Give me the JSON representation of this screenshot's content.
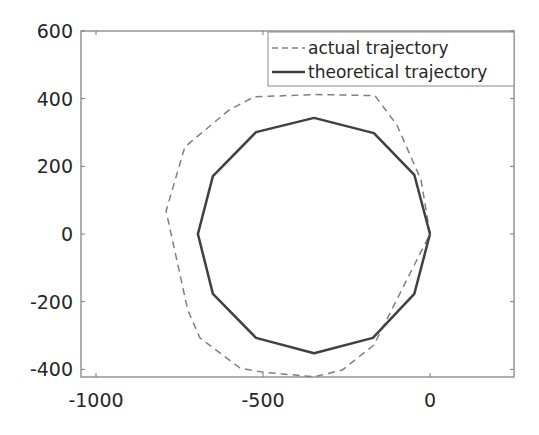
{
  "chart_data": {
    "type": "line",
    "title": "",
    "xlabel": "",
    "ylabel": "",
    "xlim": [
      -1045,
      250
    ],
    "ylim": [
      -420,
      600
    ],
    "grid": false,
    "legend_position": "upper right",
    "x_ticks": [
      -1000,
      -500,
      0
    ],
    "x_tick_labels": [
      "-1000",
      "-500",
      "0"
    ],
    "y_ticks": [
      -400,
      -200,
      0,
      200,
      400,
      600
    ],
    "y_tick_labels": [
      "-400",
      "-200",
      "0",
      "200",
      "400",
      "600"
    ],
    "series": [
      {
        "name": "actual trajectory",
        "style": "dashed",
        "color": "#7f7f7f",
        "points": [
          [
            0,
            0
          ],
          [
            -27,
            160
          ],
          [
            -99,
            322
          ],
          [
            -165,
            409
          ],
          [
            -347,
            412
          ],
          [
            -527,
            405
          ],
          [
            -602,
            366
          ],
          [
            -734,
            257
          ],
          [
            -790,
            68
          ],
          [
            -725,
            -225
          ],
          [
            -689,
            -307
          ],
          [
            -569,
            -396
          ],
          [
            -503,
            -408
          ],
          [
            -347,
            -422
          ],
          [
            -263,
            -402
          ],
          [
            -168,
            -328
          ],
          [
            0,
            0
          ]
        ]
      },
      {
        "name": "theoretical trajectory",
        "style": "solid",
        "color": "#404040",
        "points": [
          [
            0,
            0
          ],
          [
            -47,
            175
          ],
          [
            -168,
            298
          ],
          [
            -347,
            343
          ],
          [
            -521,
            301
          ],
          [
            -650,
            171
          ],
          [
            -695,
            0
          ],
          [
            -650,
            -177
          ],
          [
            -521,
            -307
          ],
          [
            -347,
            -352
          ],
          [
            -171,
            -307
          ],
          [
            -47,
            -177
          ],
          [
            0,
            0
          ]
        ]
      }
    ]
  },
  "legend": {
    "items": [
      {
        "label": "actual trajectory"
      },
      {
        "label": "theoretical trajectory"
      }
    ]
  }
}
